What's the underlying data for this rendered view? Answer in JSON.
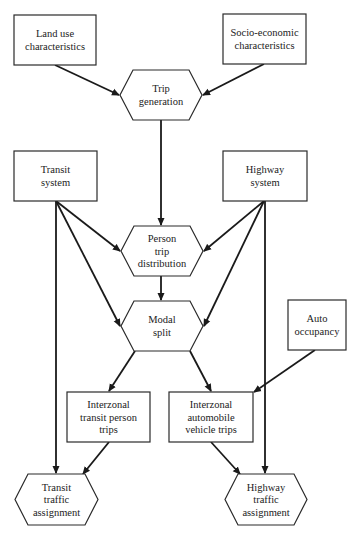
{
  "diagram": {
    "nodes": [
      {
        "id": "land_use",
        "shape": "rect",
        "lines": [
          "Land use",
          "characteristics"
        ],
        "x": 14,
        "y": 15,
        "w": 82,
        "h": 50
      },
      {
        "id": "socio_economic",
        "shape": "rect",
        "lines": [
          "Socio-economic",
          "characteristics"
        ],
        "x": 223,
        "y": 14,
        "w": 83,
        "h": 50
      },
      {
        "id": "trip_generation",
        "shape": "hexagon",
        "lines": [
          "Trip",
          "generation"
        ],
        "x": 120,
        "y": 70,
        "w": 82,
        "h": 50
      },
      {
        "id": "transit_system",
        "shape": "rect",
        "lines": [
          "Transit",
          "system"
        ],
        "x": 14,
        "y": 151,
        "w": 83,
        "h": 50
      },
      {
        "id": "highway_system",
        "shape": "rect",
        "lines": [
          "Highway",
          "system"
        ],
        "x": 223,
        "y": 151,
        "w": 84,
        "h": 50
      },
      {
        "id": "person_trip_distribution",
        "shape": "hexagon",
        "lines": [
          "Person",
          "trip",
          "distribution"
        ],
        "x": 121,
        "y": 226,
        "w": 82,
        "h": 50
      },
      {
        "id": "modal_split",
        "shape": "hexagon",
        "lines": [
          "Modal",
          "split"
        ],
        "x": 121,
        "y": 301,
        "w": 82,
        "h": 50
      },
      {
        "id": "auto_occupancy",
        "shape": "rect",
        "lines": [
          "Auto",
          "occupancy"
        ],
        "x": 288,
        "y": 300,
        "w": 58,
        "h": 50
      },
      {
        "id": "interzonal_transit",
        "shape": "rect",
        "lines": [
          "Interzonal",
          "transit person",
          "trips"
        ],
        "x": 67,
        "y": 392,
        "w": 83,
        "h": 50
      },
      {
        "id": "interzonal_auto",
        "shape": "rect",
        "lines": [
          "Interzonal",
          "automobile",
          "vehicle trips"
        ],
        "x": 169,
        "y": 392,
        "w": 84,
        "h": 50
      },
      {
        "id": "transit_assignment",
        "shape": "hexagon",
        "lines": [
          "Transit",
          "traffic",
          "assignment"
        ],
        "x": 15,
        "y": 474,
        "w": 83,
        "h": 51
      },
      {
        "id": "highway_assignment",
        "shape": "hexagon",
        "lines": [
          "Highway",
          "traffic",
          "assignment"
        ],
        "x": 225,
        "y": 474,
        "w": 82,
        "h": 51
      }
    ],
    "edges": [
      {
        "from": "land_use",
        "to": "trip_generation",
        "x1": 55,
        "y1": 65,
        "x2": 119,
        "y2": 95
      },
      {
        "from": "socio_economic",
        "to": "trip_generation",
        "x1": 264,
        "y1": 64,
        "x2": 203,
        "y2": 95
      },
      {
        "from": "trip_generation",
        "to": "person_trip_distribution",
        "x1": 161,
        "y1": 120,
        "x2": 161,
        "y2": 225
      },
      {
        "from": "transit_system",
        "to": "person_trip_distribution",
        "x1": 56,
        "y1": 201,
        "x2": 120,
        "y2": 251
      },
      {
        "from": "highway_system",
        "to": "person_trip_distribution",
        "x1": 264,
        "y1": 201,
        "x2": 204,
        "y2": 251
      },
      {
        "from": "transit_system",
        "to": "modal_split",
        "x1": 56,
        "y1": 201,
        "x2": 120,
        "y2": 326
      },
      {
        "from": "highway_system",
        "to": "modal_split",
        "x1": 264,
        "y1": 201,
        "x2": 204,
        "y2": 326
      },
      {
        "from": "person_trip_distribution",
        "to": "modal_split",
        "x1": 161,
        "y1": 276,
        "x2": 161,
        "y2": 300
      },
      {
        "from": "modal_split",
        "to": "interzonal_transit",
        "x1": 135,
        "y1": 351,
        "x2": 109,
        "y2": 391
      },
      {
        "from": "modal_split",
        "to": "interzonal_auto",
        "x1": 190,
        "y1": 351,
        "x2": 211,
        "y2": 391
      },
      {
        "from": "auto_occupancy",
        "to": "interzonal_auto",
        "x1": 315,
        "y1": 350,
        "x2": 254,
        "y2": 392
      },
      {
        "from": "transit_system",
        "to": "transit_assignment",
        "x1": 56,
        "y1": 201,
        "x2": 56,
        "y2": 473
      },
      {
        "from": "interzonal_transit",
        "to": "transit_assignment",
        "x1": 109,
        "y1": 442,
        "x2": 83,
        "y2": 474
      },
      {
        "from": "interzonal_auto",
        "to": "highway_assignment",
        "x1": 211,
        "y1": 442,
        "x2": 240,
        "y2": 474
      },
      {
        "from": "highway_system",
        "to": "highway_assignment",
        "x1": 265,
        "y1": 201,
        "x2": 265,
        "y2": 473
      }
    ]
  }
}
